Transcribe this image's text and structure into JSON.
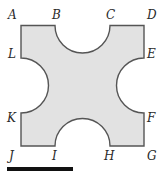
{
  "diagram": {
    "colors": {
      "shade": "#e2e2e2",
      "stroke": "#555555",
      "label": "#2a2a2a",
      "bar": "#111111"
    },
    "labels": {
      "A": "A",
      "B": "B",
      "C": "C",
      "D": "D",
      "E": "E",
      "F": "F",
      "G": "G",
      "H": "H",
      "I": "I",
      "J": "J",
      "K": "K",
      "L": "L"
    }
  }
}
